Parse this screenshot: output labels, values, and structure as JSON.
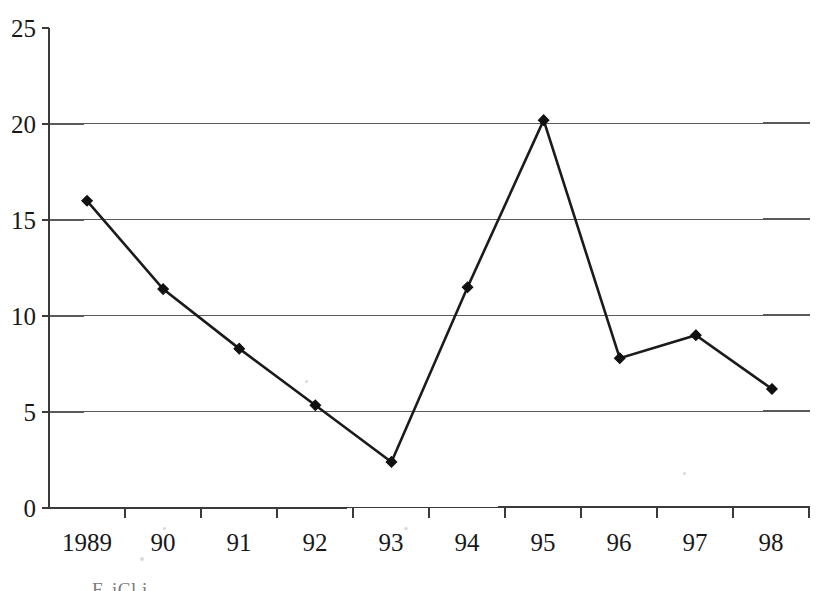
{
  "chart_data": {
    "type": "line",
    "title": "",
    "subtitle": "",
    "xlabel": "",
    "ylabel": "",
    "categories": [
      "1989",
      "90",
      "91",
      "92",
      "93",
      "94",
      "95",
      "96",
      "97",
      "98"
    ],
    "values": [
      16.0,
      11.4,
      8.3,
      5.35,
      2.4,
      11.5,
      20.2,
      7.8,
      9.0,
      6.2
    ],
    "series": [
      {
        "name": "",
        "values": [
          16.0,
          11.4,
          8.3,
          5.35,
          2.4,
          11.5,
          20.2,
          7.8,
          9.0,
          6.2
        ]
      }
    ],
    "ylim": [
      0,
      25
    ],
    "ytick_labels": [
      "0",
      "5",
      "10",
      "15",
      "20",
      "25"
    ],
    "ytick_values": [
      0,
      5,
      10,
      15,
      20,
      25
    ],
    "xtick_labels": [
      "1989",
      "90",
      "91",
      "92",
      "93",
      "94",
      "95",
      "96",
      "97",
      "98"
    ],
    "grid": true,
    "gridlines_at": [
      5,
      10,
      15,
      20
    ],
    "legend": "none",
    "legend_position": "none",
    "marker": "diamond",
    "line_color": "#1b1b1b",
    "marker_color": "#111111",
    "grid_color": "#5a5a5a",
    "axis_color": "#3a3a3a",
    "background_color": "#ffffff",
    "annotations": []
  },
  "footer": {
    "cropped_caption": "F. iCl           i"
  }
}
